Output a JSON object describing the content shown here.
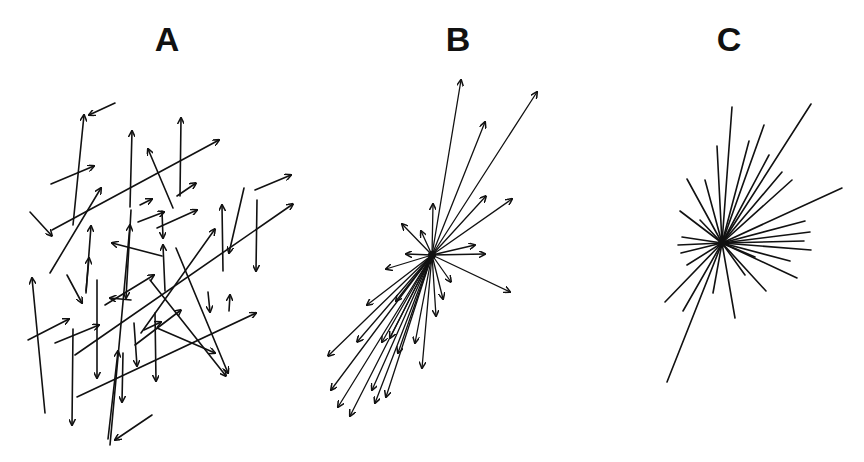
{
  "figure": {
    "ink_color": "#111111",
    "background": "#ffffff",
    "panels": [
      {
        "label": "A",
        "label_pos": [
          167,
          36
        ],
        "description": "randomly oriented and positioned arrows",
        "style": "arrows",
        "stroke_width": 1.6,
        "segments": [
          [
            115,
            103,
            89,
            115
          ],
          [
            73,
            225,
            84,
            115
          ],
          [
            51,
            184,
            94,
            166
          ],
          [
            130,
            207,
            132,
            131
          ],
          [
            180,
            196,
            181,
            118
          ],
          [
            52,
            230,
            219,
            140
          ],
          [
            173,
            208,
            148,
            149
          ],
          [
            177,
            196,
            196,
            183
          ],
          [
            30,
            212,
            52,
            236
          ],
          [
            50,
            273,
            101,
            188
          ],
          [
            140,
            205,
            152,
            199
          ],
          [
            138,
            222,
            164,
            212
          ],
          [
            162,
            211,
            163,
            238
          ],
          [
            157,
            228,
            197,
            210
          ],
          [
            165,
            291,
            163,
            245
          ],
          [
            255,
            190,
            291,
            175
          ],
          [
            244,
            188,
            229,
            253
          ],
          [
            257,
            200,
            256,
            271
          ],
          [
            223,
            271,
            222,
            205
          ],
          [
            162,
            256,
            112,
            243
          ],
          [
            86,
            293,
            91,
            226
          ],
          [
            67,
            275,
            82,
            303
          ],
          [
            86,
            291,
            89,
            258
          ],
          [
            105,
            305,
            154,
            275
          ],
          [
            45,
            413,
            32,
            278
          ],
          [
            28,
            340,
            69,
            319
          ],
          [
            55,
            343,
            99,
            325
          ],
          [
            75,
            355,
            293,
            204
          ],
          [
            97,
            280,
            97,
            378
          ],
          [
            131,
            210,
            126,
            298
          ],
          [
            110,
            445,
            130,
            225
          ],
          [
            131,
            300,
            110,
            298
          ],
          [
            141,
            333,
            215,
            229
          ],
          [
            150,
            280,
            226,
            376
          ],
          [
            176,
            248,
            228,
            373
          ],
          [
            135,
            345,
            181,
            310
          ],
          [
            144,
            330,
            161,
            322
          ],
          [
            155,
            313,
            156,
            381
          ],
          [
            134,
            323,
            137,
            366
          ],
          [
            157,
            328,
            215,
            353
          ],
          [
            208,
            292,
            210,
            312
          ],
          [
            229,
            311,
            230,
            295
          ],
          [
            77,
            397,
            256,
            313
          ],
          [
            73,
            329,
            72,
            425
          ],
          [
            123,
            353,
            122,
            402
          ],
          [
            152,
            415,
            115,
            440
          ],
          [
            108,
            439,
            118,
            351
          ]
        ]
      },
      {
        "label": "B",
        "label_pos": [
          458,
          36
        ],
        "description": "arrows radiating from a common origin, elongated along a diagonal axis",
        "style": "arrows",
        "stroke_width": 1.3,
        "origin": [
          432,
          255
        ],
        "endpoints": [
          [
            461,
            80
          ],
          [
            485,
            122
          ],
          [
            537,
            92
          ],
          [
            486,
            196
          ],
          [
            512,
            199
          ],
          [
            433,
            204
          ],
          [
            402,
            224
          ],
          [
            421,
            231
          ],
          [
            406,
            254
          ],
          [
            475,
            245
          ],
          [
            485,
            254
          ],
          [
            386,
            269
          ],
          [
            510,
            292
          ],
          [
            451,
            282
          ],
          [
            443,
            299
          ],
          [
            436,
            316
          ],
          [
            396,
            301
          ],
          [
            367,
            305
          ],
          [
            328,
            356
          ],
          [
            357,
            342
          ],
          [
            382,
            342
          ],
          [
            390,
            338
          ],
          [
            398,
            353
          ],
          [
            415,
            343
          ],
          [
            422,
            368
          ],
          [
            338,
            407
          ],
          [
            331,
            390
          ],
          [
            372,
            390
          ],
          [
            386,
            397
          ],
          [
            350,
            416
          ],
          [
            375,
            403
          ]
        ]
      },
      {
        "label": "C",
        "label_pos": [
          729,
          36
        ],
        "description": "undirected line segments radiating from a common origin",
        "style": "lines",
        "stroke_width": 1.6,
        "origin": [
          722,
          243
        ],
        "endpoints": [
          [
            732,
            107
          ],
          [
            717,
            146
          ],
          [
            749,
            141
          ],
          [
            764,
            125
          ],
          [
            811,
            104
          ],
          [
            769,
            155
          ],
          [
            782,
            172
          ],
          [
            792,
            180
          ],
          [
            842,
            188
          ],
          [
            805,
            221
          ],
          [
            810,
            232
          ],
          [
            804,
            241
          ],
          [
            811,
            250
          ],
          [
            790,
            261
          ],
          [
            797,
            278
          ],
          [
            755,
            257
          ],
          [
            766,
            291
          ],
          [
            687,
            179
          ],
          [
            705,
            180
          ],
          [
            680,
            211
          ],
          [
            700,
            220
          ],
          [
            682,
            237
          ],
          [
            678,
            245
          ],
          [
            681,
            253
          ],
          [
            687,
            265
          ],
          [
            665,
            302
          ],
          [
            683,
            311
          ],
          [
            713,
            293
          ],
          [
            735,
            318
          ],
          [
            745,
            275
          ],
          [
            667,
            382
          ]
        ]
      }
    ]
  }
}
